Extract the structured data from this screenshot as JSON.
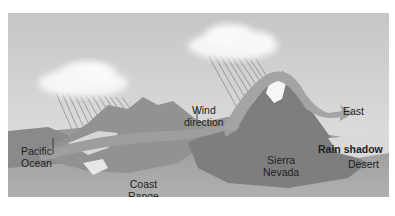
{
  "diagram": {
    "labels": {
      "pacific_line1": "Pacific",
      "pacific_line2": "Ocean",
      "wind_line1": "Wind",
      "wind_line2": "direction",
      "east": "East",
      "coast_line1": "Coast",
      "coast_line2": "Range",
      "sierra_line1": "Sierra",
      "sierra_line2": "Nevada",
      "rain_shadow": "Rain shadow",
      "desert": "Desert"
    },
    "colors": {
      "sky_top": "#c9c9c9",
      "sky_bottom": "#e4e4e4",
      "ocean": "#8a8a8a",
      "mountain": "#7d7d7d",
      "ground": "#9a9a9a",
      "arrow": "#9c9c9c",
      "cloud": "#f4f4f4"
    }
  }
}
